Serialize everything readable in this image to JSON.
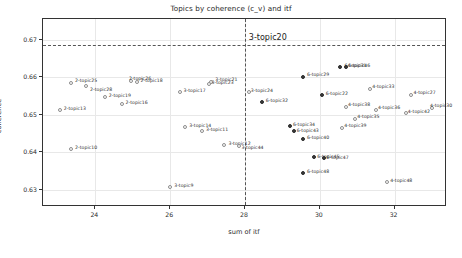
{
  "chart_data": {
    "type": "scatter",
    "title": "Topics by coherence (c_v) and itf",
    "xlabel": "sum of itf",
    "ylabel": "coherence",
    "xlim": [
      22.6,
      33.4
    ],
    "ylim": [
      0.6255,
      0.6755
    ],
    "xticks": [
      24,
      26,
      28,
      30,
      32
    ],
    "yticks": [
      "0.63",
      "0.64",
      "0.65",
      "0.66",
      "0.67"
    ],
    "grid": true,
    "legend": "none",
    "annotations": [
      {
        "text": "3-topic20",
        "x": 28.05,
        "y": 0.6695
      }
    ],
    "reference_lines": [
      {
        "orientation": "vertical",
        "value": 28.0,
        "style": "dashed"
      },
      {
        "orientation": "horizontal",
        "value": 0.6685,
        "style": "dashed"
      }
    ],
    "points": [
      {
        "label": "2-topic25",
        "x": 23.35,
        "y": 0.6585,
        "marker": "open",
        "lx": 4,
        "ly": -5
      },
      {
        "label": "2-topic28",
        "x": 23.75,
        "y": 0.6578,
        "marker": "open",
        "lx": 4,
        "ly": 1
      },
      {
        "label": "2-topic18",
        "x": 25.1,
        "y": 0.6588,
        "marker": "open",
        "lx": 4,
        "ly": -4
      },
      {
        "label": "2-topic26",
        "x": 24.95,
        "y": 0.659,
        "marker": "open",
        "lx": -2,
        "ly": -5
      },
      {
        "label": "2-topic19",
        "x": 24.25,
        "y": 0.6548,
        "marker": "open",
        "lx": 4,
        "ly": -4
      },
      {
        "label": "2-topic16",
        "x": 24.7,
        "y": 0.653,
        "marker": "open",
        "lx": 4,
        "ly": -4
      },
      {
        "label": "2-topic13",
        "x": 23.05,
        "y": 0.6512,
        "marker": "open",
        "lx": 4,
        "ly": -4
      },
      {
        "label": "2-topic10",
        "x": 23.35,
        "y": 0.6408,
        "marker": "open",
        "lx": 4,
        "ly": -4
      },
      {
        "label": "3-topic17",
        "x": 26.25,
        "y": 0.6562,
        "marker": "open",
        "lx": 4,
        "ly": -4
      },
      {
        "label": "3-topic21",
        "x": 27.1,
        "y": 0.6588,
        "marker": "open",
        "lx": 4,
        "ly": -5
      },
      {
        "label": "3-topic23",
        "x": 27.05,
        "y": 0.6582,
        "marker": "open",
        "lx": 2,
        "ly": 0
      },
      {
        "label": "3-topic14",
        "x": 26.4,
        "y": 0.6468,
        "marker": "open",
        "lx": 4,
        "ly": -4
      },
      {
        "label": "3-topic11",
        "x": 26.85,
        "y": 0.6458,
        "marker": "open",
        "lx": 4,
        "ly": -4
      },
      {
        "label": "3-topic12",
        "x": 27.45,
        "y": 0.642,
        "marker": "open",
        "lx": 4,
        "ly": -4
      },
      {
        "label": "3-topic44",
        "x": 27.85,
        "y": 0.6418,
        "marker": "open",
        "lx": 2,
        "ly": -1
      },
      {
        "label": "3-topic9",
        "x": 26.0,
        "y": 0.6308,
        "marker": "open",
        "lx": 4,
        "ly": -4
      },
      {
        "label": "3-topic24",
        "x": 28.1,
        "y": 0.6562,
        "marker": "open",
        "lx": 2,
        "ly": -4
      },
      {
        "label": "6-topic32",
        "x": 28.45,
        "y": 0.6535,
        "marker": "fill",
        "lx": 4,
        "ly": -4
      },
      {
        "label": "6-topic29",
        "x": 29.55,
        "y": 0.66,
        "marker": "fill",
        "lx": 4,
        "ly": -5
      },
      {
        "label": "6-topic22",
        "x": 30.05,
        "y": 0.6552,
        "marker": "fill",
        "lx": 4,
        "ly": -4
      },
      {
        "label": "6-topic31",
        "x": 30.55,
        "y": 0.6628,
        "marker": "fill",
        "lx": 4,
        "ly": -4
      },
      {
        "label": "6-topic46",
        "x": 30.7,
        "y": 0.6628,
        "marker": "fill",
        "lx": 2,
        "ly": -4
      },
      {
        "label": "6-topic34",
        "x": 29.2,
        "y": 0.647,
        "marker": "fill",
        "lx": 3,
        "ly": -4
      },
      {
        "label": "6-topic43",
        "x": 29.3,
        "y": 0.6458,
        "marker": "fill",
        "lx": 3,
        "ly": -3
      },
      {
        "label": "6-topic40",
        "x": 29.55,
        "y": 0.6435,
        "marker": "fill",
        "lx": 4,
        "ly": -4
      },
      {
        "label": "6-topic45",
        "x": 29.85,
        "y": 0.6388,
        "marker": "fill",
        "lx": 3,
        "ly": -3
      },
      {
        "label": "6-topic47",
        "x": 30.1,
        "y": 0.6385,
        "marker": "fill",
        "lx": 3,
        "ly": -3
      },
      {
        "label": "6-topic48",
        "x": 29.55,
        "y": 0.6345,
        "marker": "fill",
        "lx": 4,
        "ly": -4
      },
      {
        "label": "4-topic33",
        "x": 31.35,
        "y": 0.6568,
        "marker": "open",
        "lx": 2,
        "ly": -5
      },
      {
        "label": "4-topic27",
        "x": 32.45,
        "y": 0.6552,
        "marker": "open",
        "lx": 2,
        "ly": -5
      },
      {
        "label": "4-topic38",
        "x": 30.7,
        "y": 0.6522,
        "marker": "open",
        "lx": 2,
        "ly": -5
      },
      {
        "label": "4-topic36",
        "x": 31.5,
        "y": 0.6512,
        "marker": "open",
        "lx": 2,
        "ly": -5
      },
      {
        "label": "4-topic42",
        "x": 32.3,
        "y": 0.6505,
        "marker": "open",
        "lx": 2,
        "ly": -4
      },
      {
        "label": "4-topic30",
        "x": 33.0,
        "y": 0.6518,
        "marker": "open",
        "lx": -2,
        "ly": -5
      },
      {
        "label": "4-topic35",
        "x": 30.95,
        "y": 0.6488,
        "marker": "open",
        "lx": 2,
        "ly": -5
      },
      {
        "label": "4-topic39",
        "x": 30.6,
        "y": 0.6465,
        "marker": "open",
        "lx": 2,
        "ly": -5
      },
      {
        "label": "4-topic48",
        "x": 31.8,
        "y": 0.6322,
        "marker": "open",
        "lx": 3,
        "ly": -4
      }
    ]
  }
}
